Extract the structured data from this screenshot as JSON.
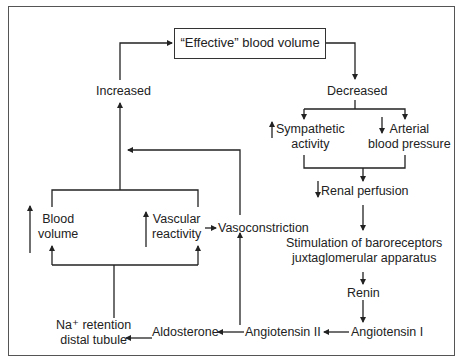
{
  "diagram": {
    "nodes": {
      "effective_blood_volume": "“Effective” blood volume",
      "increased": "Increased",
      "decreased": "Decreased",
      "sympathetic_activity": [
        "Sympathetic",
        "activity"
      ],
      "arterial_blood_pressure": [
        "Arterial",
        "blood pressure"
      ],
      "renal_perfusion": "Renal perfusion",
      "stimulation": [
        "Stimulation of baroreceptors",
        "juxtaglomerular apparatus"
      ],
      "renin": "Renin",
      "angiotensin_i": "Angiotensin I",
      "angiotensin_ii": "Angiotensin II",
      "aldosterone": "Aldosterone",
      "na_retention": [
        "Na⁺ retention",
        "distal tubule"
      ],
      "vasoconstriction": "Vasoconstriction",
      "blood_volume": [
        "Blood",
        "volume"
      ],
      "vascular_reactivity": [
        "Vascular",
        "reactivity"
      ]
    },
    "indicators": {
      "sympathetic_activity": "up",
      "arterial_blood_pressure": "down",
      "renal_perfusion": "down",
      "blood_volume": "up",
      "vascular_reactivity": "up"
    },
    "edges": [
      [
        "effective_blood_volume",
        "decreased"
      ],
      [
        "decreased",
        "sympathetic_activity"
      ],
      [
        "decreased",
        "arterial_blood_pressure"
      ],
      [
        "sympathetic_activity",
        "renal_perfusion"
      ],
      [
        "arterial_blood_pressure",
        "renal_perfusion"
      ],
      [
        "renal_perfusion",
        "stimulation"
      ],
      [
        "stimulation",
        "renin"
      ],
      [
        "renin",
        "angiotensin_i"
      ],
      [
        "angiotensin_i",
        "angiotensin_ii"
      ],
      [
        "angiotensin_ii",
        "aldosterone"
      ],
      [
        "aldosterone",
        "na_retention"
      ],
      [
        "angiotensin_ii",
        "vasoconstriction"
      ],
      [
        "vascular_reactivity",
        "vasoconstriction"
      ],
      [
        "na_retention",
        "blood_volume"
      ],
      [
        "na_retention",
        "vascular_reactivity"
      ],
      [
        "blood_volume",
        "increased"
      ],
      [
        "vascular_reactivity",
        "increased"
      ],
      [
        "vasoconstriction",
        "increased"
      ],
      [
        "increased",
        "effective_blood_volume"
      ]
    ]
  }
}
